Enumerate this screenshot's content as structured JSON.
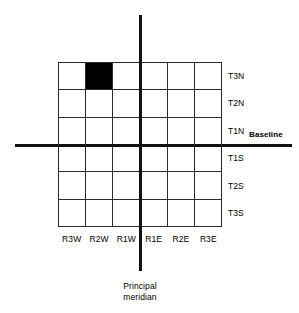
{
  "diagram": {
    "grid": {
      "rows": 6,
      "columns": 6,
      "highlighted_cell": {
        "row": 0,
        "column": 1,
        "township": "T3N",
        "range": "R2W"
      },
      "fill_color": "#000000",
      "line_color": "#2b2b2b"
    },
    "row_labels": [
      "T3N",
      "T2N",
      "T1N",
      "T1S",
      "T2S",
      "T3S"
    ],
    "column_labels": [
      "R3W",
      "R2W",
      "R1W",
      "R1E",
      "R2E",
      "R3E"
    ],
    "baseline_label": "Baseline",
    "meridian_label_line1": "Principal",
    "meridian_label_line2": "meridian",
    "axis_color": "#111111"
  }
}
